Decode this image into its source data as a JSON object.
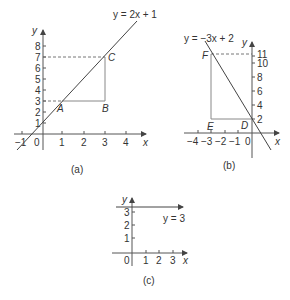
{
  "graph_a": {
    "equation": "y = 2x + 1",
    "x_axis_label": "x",
    "y_axis_label": "y",
    "x_ticks": [
      "−1",
      "0",
      "1",
      "2",
      "3",
      "4"
    ],
    "y_ticks": [
      "1",
      "2",
      "3",
      "4",
      "5",
      "6",
      "7",
      "8"
    ],
    "points": {
      "A": "A",
      "B": "B",
      "C": "C"
    },
    "caption": "(a)"
  },
  "graph_b": {
    "equation": "y = −3x + 2",
    "x_axis_label": "x",
    "y_axis_label": "y",
    "x_ticks": [
      "−4",
      "−3",
      "−2",
      "−1",
      "0"
    ],
    "y_ticks": [
      "2",
      "4",
      "6",
      "8",
      "10",
      "11"
    ],
    "points": {
      "D": "D",
      "E": "E",
      "F": "F"
    },
    "caption": "(b)"
  },
  "graph_c": {
    "equation": "y = 3",
    "x_axis_label": "x",
    "y_axis_label": "y",
    "x_ticks": [
      "0",
      "1",
      "2",
      "3"
    ],
    "y_ticks": [
      "1",
      "2",
      "3"
    ],
    "caption": "(c)"
  }
}
